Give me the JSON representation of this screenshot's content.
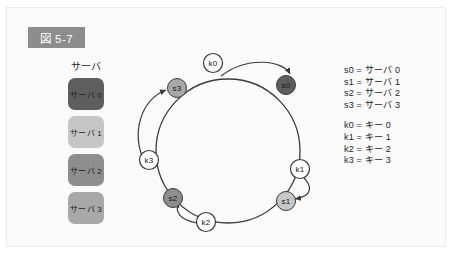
{
  "figure": {
    "badge_label": "図 5-7",
    "badge_color": "#8d8d8d",
    "panel_background": "#fafafa",
    "panel_border": "#ececed"
  },
  "server_legend": {
    "title": "サーバ",
    "items": [
      {
        "label": "サーバ 0",
        "color": "#5e5e5e"
      },
      {
        "label": "サーバ 1",
        "color": "#c6c6c6"
      },
      {
        "label": "サーバ 2",
        "color": "#8e8e8e"
      },
      {
        "label": "サーバ 3",
        "color": "#a8a8a8"
      }
    ]
  },
  "key_legend": {
    "server_lines": [
      "s0 = サーバ 0",
      "s1 = サーバ 1",
      "s2 = サーバ 2",
      "s3 = サーバ 3"
    ],
    "key_lines": [
      "k0 = キー 0",
      "k1 = キー 1",
      "k2 = キー 2",
      "k3 = キー 3"
    ]
  },
  "ring": {
    "center_x": 227,
    "center_y": 150,
    "radius": 72,
    "stroke_color": "#3a3a3a",
    "server_nodes": [
      {
        "id": "s0",
        "label": "s0",
        "x": 285,
        "y": 84,
        "r": 9.5,
        "fill": "#5e5e5e",
        "text_color": "#151515"
      },
      {
        "id": "s1",
        "label": "s1",
        "x": 285,
        "y": 200,
        "r": 9.5,
        "fill": "#c6c6c6",
        "text_color": "#151515"
      },
      {
        "id": "s2",
        "label": "s2",
        "x": 180,
        "y": 196,
        "r": 9.5,
        "fill": "#8e8e8e",
        "text_color": "#151515"
      },
      {
        "id": "s3",
        "label": "s3",
        "x": 176,
        "y": 87,
        "r": 9.5,
        "fill": "#a8a8a8",
        "text_color": "#151515"
      }
    ],
    "key_nodes": [
      {
        "id": "k0",
        "label": "k0",
        "x": 212,
        "y": 62,
        "r": 9.5,
        "fill": "#ffffff",
        "text_color": "#151515"
      },
      {
        "id": "k1",
        "label": "k1",
        "x": 299,
        "y": 168,
        "r": 9.5,
        "fill": "#ffffff",
        "text_color": "#151515"
      },
      {
        "id": "k2",
        "label": "k2",
        "x": 205,
        "y": 220,
        "r": 9.5,
        "fill": "#ffffff",
        "text_color": "#151515"
      },
      {
        "id": "k3",
        "label": "k3",
        "x": 148,
        "y": 159,
        "r": 9.5,
        "fill": "#ffffff",
        "text_color": "#151515"
      }
    ],
    "mappings": [
      {
        "from": "k0",
        "to": "s0"
      },
      {
        "from": "k1",
        "to": "s1"
      },
      {
        "from": "k2",
        "to": "s2"
      },
      {
        "from": "k3",
        "to": "s3"
      }
    ]
  }
}
